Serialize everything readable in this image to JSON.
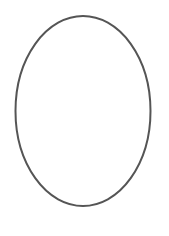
{
  "figure": {
    "background": "#ffffff",
    "shapes": [
      {
        "type": "ellipse",
        "cx": 83,
        "cy": 111,
        "rx": 67.5,
        "ry": 95,
        "stroke": "#555555",
        "stroke_width": 2,
        "fill": "none"
      }
    ]
  }
}
